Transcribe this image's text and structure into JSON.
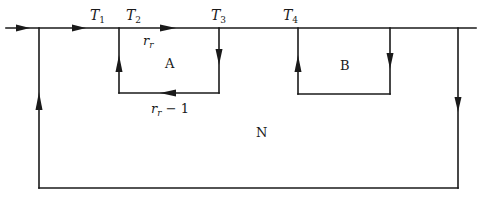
{
  "diagram": {
    "type": "flow-network",
    "colors": {
      "line": "#1a1a1a",
      "background": "#ffffff"
    },
    "labels": {
      "T1": {
        "main": "T",
        "sub": "1"
      },
      "T2": {
        "main": "T",
        "sub": "2"
      },
      "T3": {
        "main": "T",
        "sub": "3"
      },
      "T4": {
        "main": "T",
        "sub": "4"
      },
      "rr_top": {
        "main": "r",
        "sub": "r"
      },
      "rr_bottom": {
        "main": "r",
        "sub": "r",
        "suffix": " − 1"
      },
      "loop_a": "A",
      "loop_b": "B",
      "outer_loop": "N"
    },
    "nodes": [
      "T1",
      "T2",
      "T3",
      "T4"
    ],
    "loops": [
      {
        "name": "A",
        "from": "T2",
        "to": "T3",
        "feedback": "r_r - 1"
      },
      {
        "name": "B",
        "from": "T4",
        "to": "T4-right"
      },
      {
        "name": "N",
        "outer": true
      }
    ]
  }
}
